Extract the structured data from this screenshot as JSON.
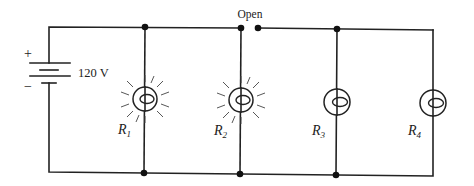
{
  "diagram": {
    "type": "parallel-circuit",
    "battery": {
      "voltage_label": "120 V",
      "positive_label": "+",
      "negative_label": "−"
    },
    "switch": {
      "state_label": "Open"
    },
    "resistors": [
      {
        "symbol": "R",
        "subscript": "1",
        "state": "lit"
      },
      {
        "symbol": "R",
        "subscript": "2",
        "state": "lit"
      },
      {
        "symbol": "R",
        "subscript": "3",
        "state": "unlit"
      },
      {
        "symbol": "R",
        "subscript": "4",
        "state": "unlit"
      }
    ],
    "colors": {
      "wire": "#222222",
      "background": "#ffffff"
    }
  }
}
